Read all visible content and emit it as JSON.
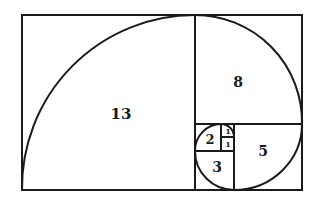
{
  "diagram": {
    "stroke_color": "#1a1a1a",
    "squares": [
      {
        "label": "13",
        "x": 22,
        "y": 15,
        "size": 173,
        "label_x": 121,
        "label_y": 114,
        "font": 15
      },
      {
        "label": "8",
        "x": 195,
        "y": 15,
        "size": 107,
        "label_x": 238,
        "label_y": 82,
        "font": 14
      },
      {
        "label": "5",
        "x": 234,
        "y": 124,
        "size": 68,
        "label_x": 263,
        "label_y": 151,
        "font": 14
      },
      {
        "label": "3",
        "x": 195,
        "y": 151,
        "size": 39,
        "label_x": 217,
        "label_y": 167,
        "font": 14
      },
      {
        "label": "2",
        "x": 195,
        "y": 124,
        "size": 26,
        "label_x": 210,
        "label_y": 139,
        "font": 13
      },
      {
        "label": "1",
        "x": 221,
        "y": 124,
        "size": 13,
        "label_x": 228,
        "label_y": 130,
        "font": 8
      },
      {
        "label": "1",
        "x": 221,
        "y": 137,
        "size": 14,
        "label_x": 228,
        "label_y": 144,
        "font": 8
      }
    ]
  }
}
